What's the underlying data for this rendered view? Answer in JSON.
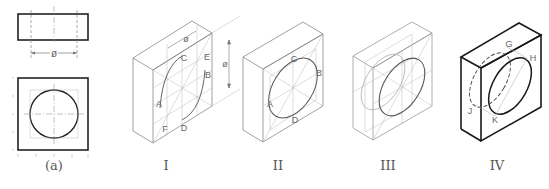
{
  "figure": {
    "orthographic": {
      "label": "(a)",
      "dimension_symbol": "ø"
    },
    "steps": [
      {
        "id": "I",
        "label": "I",
        "points": [
          "A",
          "B",
          "C",
          "D",
          "E",
          "F"
        ],
        "dimension_symbol": "ø",
        "height_symbol": "ø"
      },
      {
        "id": "II",
        "label": "II",
        "points": [
          "A",
          "B",
          "C",
          "D"
        ]
      },
      {
        "id": "III",
        "label": "III",
        "points": []
      },
      {
        "id": "IV",
        "label": "IV",
        "points": [
          "G",
          "H",
          "J",
          "K"
        ]
      }
    ],
    "colors": {
      "construction": "#b0b0b0",
      "outline": "#777777",
      "final": "#1a1a1a",
      "text": "#555555"
    }
  }
}
